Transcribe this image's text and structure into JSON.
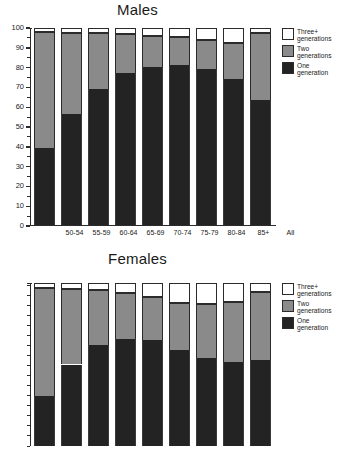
{
  "charts": {
    "males": {
      "title": "Males"
    },
    "females": {
      "title": "Females"
    }
  },
  "legend": {
    "items": [
      {
        "key": "three",
        "label": "Three+\ngenerations"
      },
      {
        "key": "two",
        "label": "Two generations"
      },
      {
        "key": "one",
        "label": "One generation"
      }
    ]
  },
  "axis": {
    "y_ticks": [
      "0",
      "10",
      "20",
      "30",
      "40",
      "50",
      "60",
      "70",
      "80",
      "90",
      "100"
    ],
    "y_ticks_females_visible": [
      "20",
      "30",
      "40",
      "50",
      "60",
      "70",
      "80",
      "90",
      "100"
    ]
  },
  "colors": {
    "one_generation": "#232323",
    "two_generations": "#8a8a8a",
    "three_plus_generations": "#ffffff",
    "axis": "#2b2b2b",
    "background": "#ffffff"
  },
  "chart_data": [
    {
      "type": "bar",
      "subtype": "stacked-percent",
      "title": "Males",
      "xlabel": "",
      "ylabel": "",
      "ylim": [
        0,
        100
      ],
      "ytick_step": 10,
      "yminor_step": 5,
      "grid": false,
      "legend_position": "right",
      "categories": [
        "50-54",
        "55-59",
        "60-64",
        "65-69",
        "70-74",
        "75-79",
        "80-84",
        "85+",
        "All"
      ],
      "series": [
        {
          "name": "One generation",
          "values": [
            39.5,
            56.5,
            69.0,
            77.5,
            80.5,
            81.5,
            79.5,
            74.0,
            63.5
          ]
        },
        {
          "name": "Two generations",
          "values": [
            58.5,
            41.0,
            28.5,
            19.5,
            15.5,
            14.0,
            14.5,
            18.5,
            34.0
          ]
        },
        {
          "name": "Three+ generations",
          "values": [
            2.0,
            2.5,
            2.5,
            3.0,
            4.0,
            4.5,
            6.0,
            7.5,
            2.5
          ]
        }
      ],
      "cumulative_tops": {
        "one_generation": [
          39.5,
          56.5,
          69.0,
          77.5,
          80.5,
          81.5,
          79.5,
          74.0,
          63.5
        ],
        "two_generations": [
          98.0,
          97.5,
          97.5,
          97.0,
          96.0,
          95.5,
          94.0,
          92.5,
          97.5
        ]
      }
    },
    {
      "type": "bar",
      "subtype": "stacked-percent",
      "title": "Females",
      "xlabel": "",
      "ylabel": "",
      "ylim": [
        0,
        100
      ],
      "ytick_step": 10,
      "yminor_step": 5,
      "grid": false,
      "legend_position": "right",
      "note": "Chart is cropped at the bottom of the screenshot near the value 20.",
      "categories": [
        "50-54",
        "55-59",
        "60-64",
        "65-69",
        "70-74",
        "75-79",
        "80-84",
        "85+",
        "All"
      ],
      "series": [
        {
          "name": "One generation",
          "values": [
            44.0,
            59.5,
            69.0,
            72.0,
            71.5,
            66.5,
            62.5,
            60.5,
            61.5
          ]
        },
        {
          "name": "Two generations",
          "values": [
            53.5,
            37.5,
            27.5,
            23.0,
            21.5,
            23.5,
            27.0,
            30.0,
            34.0
          ]
        },
        {
          "name": "Three+ generations",
          "values": [
            2.5,
            3.0,
            3.5,
            5.0,
            7.0,
            10.0,
            10.5,
            9.5,
            4.5
          ]
        }
      ],
      "cumulative_tops": {
        "one_generation": [
          44.0,
          59.5,
          69.0,
          72.0,
          71.5,
          66.5,
          62.5,
          60.5,
          61.5
        ],
        "two_generations": [
          97.5,
          97.0,
          96.5,
          95.0,
          93.0,
          90.0,
          89.5,
          90.5,
          95.5
        ]
      }
    }
  ]
}
